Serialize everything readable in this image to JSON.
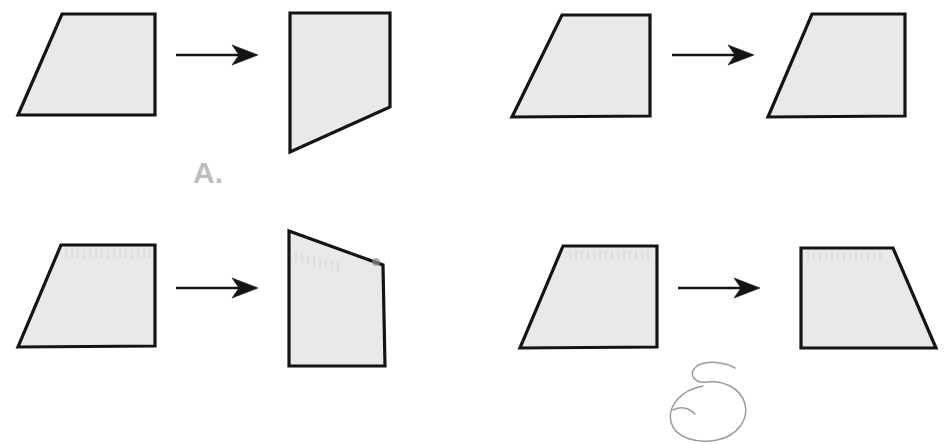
{
  "page": {
    "background_color": "#ffffff",
    "width": 946,
    "height": 444
  },
  "style": {
    "shape_fill": "#e9e9e9",
    "shape_stroke": "#141414",
    "label_color": "#bdbdbd",
    "pencil_color": "#9a9a9a"
  },
  "choices": [
    {
      "id": "A",
      "label": "A.",
      "left_shape": {
        "name": "trapezoid-right-angled",
        "points": "62,14 155,14 155,115 18,115"
      },
      "arrow": {
        "name": "transformation-arrow",
        "line": "176,55 250,55",
        "head": "256,55 236,47 241,55 236,63"
      },
      "right_shape": {
        "name": "quadrilateral-cut-corner",
        "points": "290,13 390,13 390,107 290,152"
      }
    },
    {
      "id": "B",
      "label": "B.",
      "left_shape": {
        "name": "trapezoid-right-angled",
        "points": "562,15 650,15 650,116 512,117"
      },
      "arrow": {
        "name": "transformation-arrow",
        "line": "672,55 748,55"
      },
      "right_shape": {
        "name": "trapezoid-right-angled-translated",
        "points": "812,14 905,14 905,116 768,117"
      }
    },
    {
      "id": "C",
      "label": "C.",
      "left_shape": {
        "name": "trapezoid-right-angled",
        "points": "61,245 155,245 155,346 18,347"
      },
      "arrow": {
        "name": "transformation-arrow",
        "line": "176,288 250,288"
      },
      "right_shape": {
        "name": "quadrilateral-slanted-top",
        "points": "289,231 383,265 385,366 289,366"
      }
    },
    {
      "id": "D",
      "label": "D.",
      "left_shape": {
        "name": "trapezoid-right-angled",
        "points": "563,246 657,246 657,347 520,348"
      },
      "arrow": {
        "name": "transformation-arrow",
        "line": "678,288 752,288"
      },
      "right_shape": {
        "name": "trapezoid-mirrored",
        "points": "801,248 893,248 936,348 801,348"
      },
      "annotation": {
        "name": "pencil-circle-mark",
        "description": "hand-drawn circle around label D"
      }
    }
  ]
}
